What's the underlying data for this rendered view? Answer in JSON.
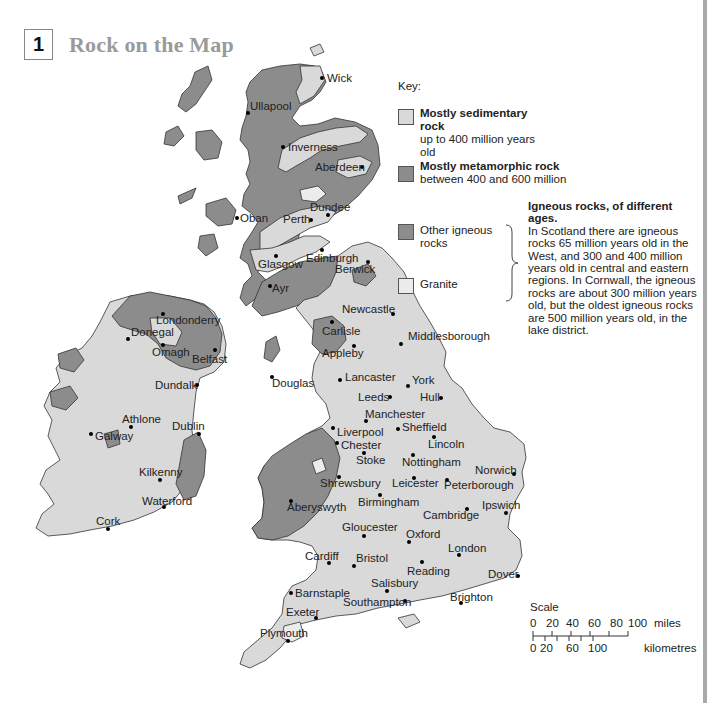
{
  "header": {
    "section_number": "1",
    "title": "Rock on the Map"
  },
  "key": {
    "title": "Key:",
    "items": [
      {
        "label": "Mostly sedimentary rock",
        "sublabel": "up to 400 million years old",
        "color": "#d9d9d9"
      },
      {
        "label": "Mostly metamorphic rock",
        "sublabel": "between 400 and 600 million",
        "color": "#8c8c8c"
      },
      {
        "label": "Other igneous rocks",
        "sublabel": "",
        "color": "#8c8c8c"
      },
      {
        "label": "Granite",
        "sublabel": "",
        "color": "#ececec"
      }
    ]
  },
  "note": {
    "heading": "Igneous rocks, of different ages.",
    "body": "In Scotland there are igneous rocks 65 million years old in the West, and 300 and 400 million years old in central and eastern regions. In Cornwall, the igneous rocks are about 300 million years old, but the oldest igneous rocks are 500 million years old, in the lake district."
  },
  "scale": {
    "title": "Scale",
    "miles_ticks": [
      "0",
      "20",
      "40",
      "60",
      "80",
      "100"
    ],
    "miles_unit": "miles",
    "km_ticks": [
      "0",
      "20",
      "60",
      "100"
    ],
    "km_unit": "kilometres"
  },
  "cities": [
    {
      "name": "Wick"
    },
    {
      "name": "Ullapool"
    },
    {
      "name": "Inverness"
    },
    {
      "name": "Aberdeen"
    },
    {
      "name": "Dundee"
    },
    {
      "name": "Perth"
    },
    {
      "name": "Oban"
    },
    {
      "name": "Edinburgh"
    },
    {
      "name": "Glasgow"
    },
    {
      "name": "Berwick"
    },
    {
      "name": "Ayr"
    },
    {
      "name": "Newcastle"
    },
    {
      "name": "Carlisle"
    },
    {
      "name": "Middlesborough"
    },
    {
      "name": "Appleby"
    },
    {
      "name": "Douglas"
    },
    {
      "name": "Lancaster"
    },
    {
      "name": "York"
    },
    {
      "name": "Leeds"
    },
    {
      "name": "Hull"
    },
    {
      "name": "Manchester"
    },
    {
      "name": "Liverpool"
    },
    {
      "name": "Sheffield"
    },
    {
      "name": "Chester"
    },
    {
      "name": "Lincoln"
    },
    {
      "name": "Stoke"
    },
    {
      "name": "Nottingham"
    },
    {
      "name": "Norwich"
    },
    {
      "name": "Shrewsbury"
    },
    {
      "name": "Leicester"
    },
    {
      "name": "Peterborough"
    },
    {
      "name": "Birmingham"
    },
    {
      "name": "Aberyswyth"
    },
    {
      "name": "Ipswich"
    },
    {
      "name": "Cambridge"
    },
    {
      "name": "Gloucester"
    },
    {
      "name": "Oxford"
    },
    {
      "name": "London"
    },
    {
      "name": "Cardiff"
    },
    {
      "name": "Bristol"
    },
    {
      "name": "Reading"
    },
    {
      "name": "Dover"
    },
    {
      "name": "Salisbury"
    },
    {
      "name": "Barnstaple"
    },
    {
      "name": "Brighton"
    },
    {
      "name": "Southampton"
    },
    {
      "name": "Exeter"
    },
    {
      "name": "Plymouth"
    },
    {
      "name": "Londonderry"
    },
    {
      "name": "Donegal"
    },
    {
      "name": "Omagh"
    },
    {
      "name": "Belfast"
    },
    {
      "name": "Dundalk"
    },
    {
      "name": "Athlone"
    },
    {
      "name": "Dublin"
    },
    {
      "name": "Galway"
    },
    {
      "name": "Kilkenny"
    },
    {
      "name": "Waterford"
    },
    {
      "name": "Cork"
    }
  ]
}
